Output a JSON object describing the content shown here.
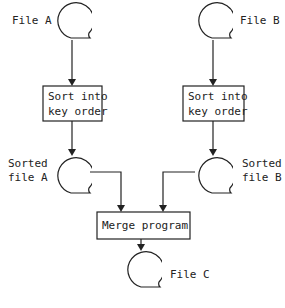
{
  "diagram": {
    "type": "flowchart",
    "files": {
      "file_a": "File A",
      "file_b": "File B",
      "sorted_a_line1": "Sorted",
      "sorted_a_line2": "file A",
      "sorted_b_line1": "Sorted",
      "sorted_b_line2": "file B",
      "file_c": "File C"
    },
    "processes": {
      "sort_a_line1": "Sort into",
      "sort_a_line2": "key order",
      "sort_b_line1": "Sort into",
      "sort_b_line2": "key order",
      "merge": "Merge program"
    },
    "edges": [
      [
        "File A",
        "Sort into key order (A)"
      ],
      [
        "Sort into key order (A)",
        "Sorted file A"
      ],
      [
        "File B",
        "Sort into key order (B)"
      ],
      [
        "Sort into key order (B)",
        "Sorted file B"
      ],
      [
        "Sorted file A",
        "Merge program"
      ],
      [
        "Sorted file B",
        "Merge program"
      ],
      [
        "Merge program",
        "File C"
      ]
    ],
    "colors": {
      "stroke": "#222222",
      "background": "#ffffff"
    }
  }
}
